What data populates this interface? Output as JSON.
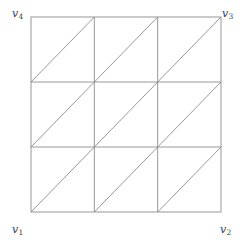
{
  "figure": {
    "kind": "triangulated-square-mesh",
    "geometry": {
      "square": {
        "x": 31,
        "y": 17,
        "width": 190,
        "height": 195
      },
      "rows": 3,
      "columns": 3,
      "diagonal_direction": "bottom-left-to-top-right",
      "vertical_gridlines_x": [
        31,
        94.33,
        157.67,
        221
      ],
      "horizontal_gridlines_y": [
        17,
        82,
        147,
        212
      ],
      "diagonal_segments": [
        {
          "x1": 31,
          "y1": 82,
          "x2": 94.33,
          "y2": 17
        },
        {
          "x1": 94.33,
          "y1": 82,
          "x2": 157.67,
          "y2": 17
        },
        {
          "x1": 157.67,
          "y1": 82,
          "x2": 221,
          "y2": 17
        },
        {
          "x1": 31,
          "y1": 147,
          "x2": 94.33,
          "y2": 82
        },
        {
          "x1": 94.33,
          "y1": 147,
          "x2": 157.67,
          "y2": 82
        },
        {
          "x1": 157.67,
          "y1": 147,
          "x2": 221,
          "y2": 82
        },
        {
          "x1": 31,
          "y1": 212,
          "x2": 94.33,
          "y2": 147
        },
        {
          "x1": 94.33,
          "y1": 212,
          "x2": 157.67,
          "y2": 147
        },
        {
          "x1": 157.67,
          "y1": 212,
          "x2": 221,
          "y2": 147
        }
      ]
    },
    "style": {
      "background_color": "#ffffff",
      "line_color": "#8c8c8c",
      "border_color": "#8c8c8c",
      "line_width": 0.9,
      "label_color": "#3a3a3a"
    },
    "labels": {
      "bottom_left": {
        "base": "v",
        "sub": "1",
        "text": "v1"
      },
      "bottom_right": {
        "base": "v",
        "sub": "2",
        "text": "v2"
      },
      "top_right": {
        "base": "v",
        "sub": "3",
        "text": "v3"
      },
      "top_left": {
        "base": "v",
        "sub": "4",
        "text": "v4"
      }
    }
  }
}
